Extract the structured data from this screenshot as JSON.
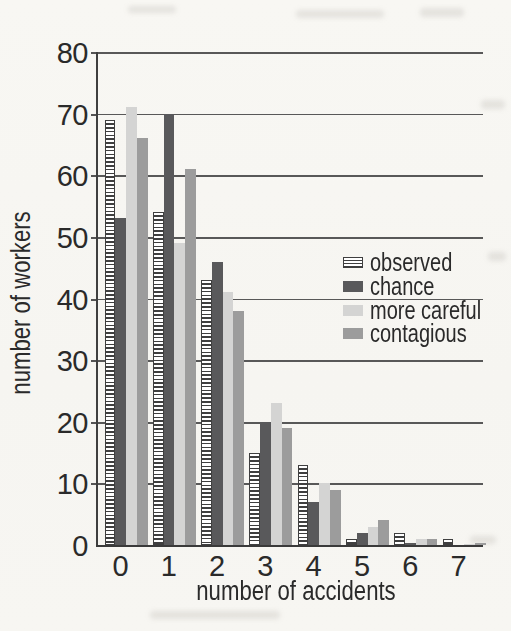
{
  "chart_data": {
    "type": "bar",
    "title": "",
    "xlabel": "number of accidents",
    "ylabel": "number of workers",
    "categories": [
      "0",
      "1",
      "2",
      "3",
      "4",
      "5",
      "6",
      "7"
    ],
    "series": [
      {
        "name": "observed",
        "style": "striped",
        "color": "#ffffff",
        "values": [
          69,
          54,
          43,
          15,
          13,
          1,
          2,
          1
        ]
      },
      {
        "name": "chance",
        "style": "solid",
        "color": "#59595b",
        "values": [
          53,
          70,
          46,
          20,
          7,
          2,
          0.3,
          0
        ]
      },
      {
        "name": "more careful",
        "style": "solid",
        "color": "#d4d4d3",
        "values": [
          71,
          49,
          41,
          23,
          10,
          3,
          1,
          0.2
        ]
      },
      {
        "name": "contagious",
        "style": "solid",
        "color": "#9c9c9c",
        "values": [
          66,
          61,
          38,
          19,
          9,
          4,
          1,
          0.4
        ]
      }
    ],
    "ylim": [
      0,
      80
    ],
    "ytick_interval": 10,
    "xticks": [
      "0",
      "1",
      "2",
      "3",
      "4",
      "5",
      "6",
      "7"
    ],
    "yticks": [
      "0",
      "10",
      "20",
      "30",
      "40",
      "50",
      "60",
      "70",
      "80"
    ],
    "grid": "horizontal gridlines every 10, drawn across full plot width",
    "legend_position": "right-middle, overlapping plot area, no border"
  },
  "colors": {
    "paper": "#f7f6f2",
    "axis_line": "#3f3f3f",
    "gridline": "#424242",
    "text": "#2a2a2a",
    "stripe_dark": "#3f3f3f",
    "bar_chance": "#59595b",
    "bar_more_careful": "#d4d4d3",
    "bar_contagious": "#9c9c9c"
  }
}
